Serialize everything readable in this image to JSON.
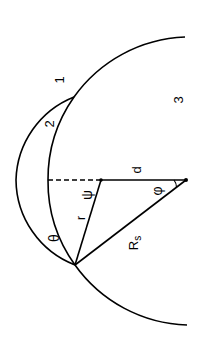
{
  "diagram": {
    "colors": {
      "line": "#000000",
      "background": "#ffffff"
    },
    "labels": {
      "region1": "1",
      "region2": "2",
      "region3": "3",
      "distance": "d",
      "small_radius": "r",
      "large_radius": "R",
      "large_radius_sub": "s",
      "angle_theta": "θ",
      "angle_psi": "ψ",
      "angle_phi": "φ"
    }
  }
}
